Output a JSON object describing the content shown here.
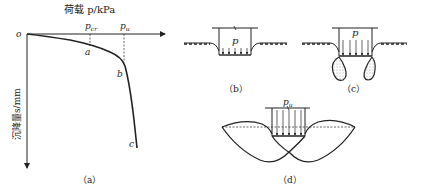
{
  "panel_a": {
    "x_axis_label": "荷载 p/kPa",
    "y_axis_label": "沉降量s/mm",
    "origin_label": "o",
    "tick_pcr": "p",
    "tick_pcr_sub": "cr",
    "tick_pu": "p",
    "tick_pu_sub": "u",
    "point_a": "a",
    "point_b": "b",
    "point_c": "c",
    "caption": "（a）"
  },
  "panel_b": {
    "load_label": "p",
    "caption": "（b）"
  },
  "panel_c": {
    "load_label": "p",
    "caption": "（c）"
  },
  "panel_d": {
    "load_label": "p",
    "load_sub": "u",
    "caption": "（d）"
  },
  "colors": {
    "line": "#222222",
    "background": "#ffffff"
  }
}
